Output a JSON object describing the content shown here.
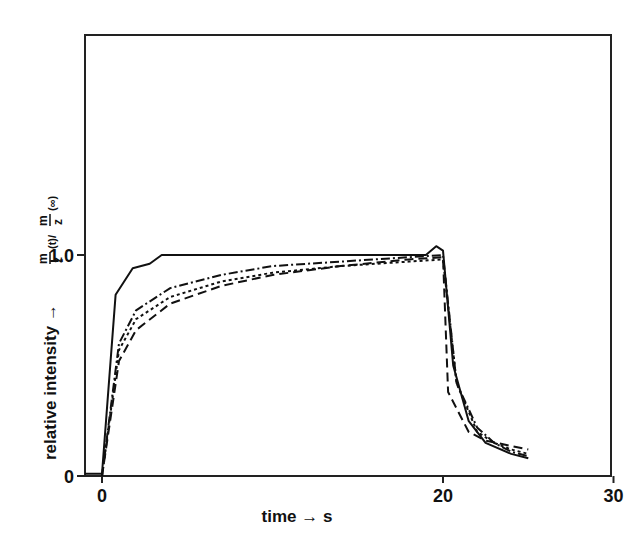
{
  "chart_data": {
    "type": "line",
    "title": "",
    "xlabel": "time → s",
    "ylabel": "relative intensity →",
    "ylabel_formula": "m/z (t) / m/z (∞)",
    "xlim": [
      -1,
      40
    ],
    "ylim": [
      0,
      2
    ],
    "x_ticks": [
      0,
      20,
      30
    ],
    "x_tick_labels": [
      "0",
      "20",
      "30"
    ],
    "y_ticks": [
      0,
      1.0
    ],
    "y_tick_labels": [
      "0",
      "1.0"
    ],
    "grid": false,
    "legend": null,
    "series": [
      {
        "name": "solid",
        "style": "solid",
        "x": [
          -1,
          0,
          0.8,
          1.8,
          2.8,
          3.5,
          10,
          19,
          19.6,
          20,
          20.6,
          21.5,
          22.5,
          24,
          25
        ],
        "y": [
          0.01,
          0.01,
          0.82,
          0.94,
          0.96,
          1.0,
          1.0,
          1.0,
          1.04,
          1.02,
          0.5,
          0.25,
          0.15,
          0.1,
          0.08
        ]
      },
      {
        "name": "dash-dot",
        "style": "dashdot",
        "x": [
          0,
          1,
          2,
          4,
          7,
          10,
          14,
          18,
          20,
          20.8,
          22,
          23,
          24,
          25
        ],
        "y": [
          0,
          0.6,
          0.75,
          0.85,
          0.91,
          0.95,
          0.97,
          0.99,
          1.0,
          0.42,
          0.22,
          0.15,
          0.11,
          0.09
        ]
      },
      {
        "name": "dotted",
        "style": "dotted",
        "x": [
          0,
          1,
          2,
          4,
          7,
          10,
          14,
          18,
          20,
          20.8,
          22,
          23,
          24,
          25
        ],
        "y": [
          0,
          0.57,
          0.71,
          0.81,
          0.88,
          0.92,
          0.95,
          0.97,
          0.98,
          0.42,
          0.2,
          0.15,
          0.12,
          0.1
        ]
      },
      {
        "name": "dashed",
        "style": "dashed",
        "x": [
          0,
          1,
          2,
          4,
          7,
          10,
          14,
          18,
          20,
          20.3,
          21.5,
          22.5,
          25
        ],
        "y": [
          0,
          0.52,
          0.66,
          0.78,
          0.86,
          0.91,
          0.95,
          0.98,
          0.99,
          0.38,
          0.2,
          0.16,
          0.12
        ]
      }
    ]
  }
}
